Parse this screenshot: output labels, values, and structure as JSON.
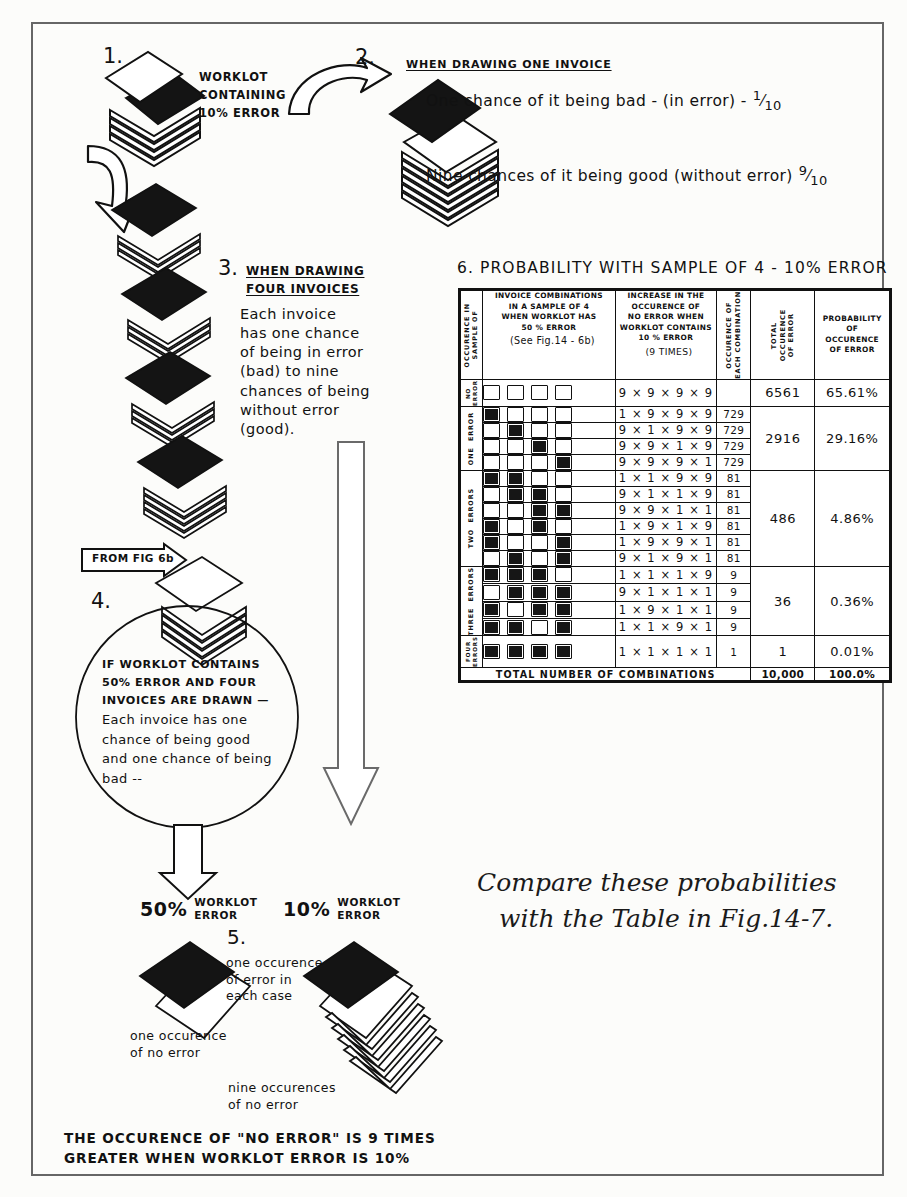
{
  "figure": {
    "title_top_right": "6.  PROBABILITY WITH SAMPLE OF 4 - 10% ERROR",
    "closing_note_line1": "Compare these probabilities",
    "closing_note_line2": "with the Table in Fig.14-7.",
    "bottom_conclusion_line1": "THE OCCURENCE OF \"NO ERROR\" IS 9 TIMES",
    "bottom_conclusion_line2": "GREATER WHEN WORKLOT ERROR IS 10%",
    "ink_color": "#111111",
    "paper_color": "#fcfcfa"
  },
  "step1": {
    "number": "1.",
    "label_line1": "WORKLOT",
    "label_line2": "CONTAINING",
    "label_line3": "10% ERROR"
  },
  "step2": {
    "number": "2.",
    "heading": "WHEN DRAWING ONE INVOICE",
    "line1": "One chance of it being bad - (in error) -",
    "line1_fraction_num": "1",
    "line1_fraction_den": "10",
    "line2": "Nine chances of it being good (without error)",
    "line2_fraction_num": "9",
    "line2_fraction_den": "10"
  },
  "step3": {
    "number": "3.",
    "heading_line1": "WHEN DRAWING",
    "heading_line2": "FOUR INVOICES",
    "body_lines": [
      "Each invoice",
      "has one chance",
      "of being in error",
      "(bad) to nine",
      "chances of being",
      "without error",
      "(good)."
    ]
  },
  "step4": {
    "number": "4.",
    "from_tag": "FROM FIG 6b",
    "bubble_lines": [
      "IF WORKLOT CONTAINS",
      "50% ERROR AND FOUR",
      "INVOICES ARE DRAWN —",
      "Each invoice has  one",
      "chance of being good",
      "and one chance of being",
      "bad --"
    ]
  },
  "branches": {
    "left_pct": "50%",
    "left_label_line1": "WORKLOT",
    "left_label_line2": "ERROR",
    "right_pct": "10%",
    "right_label_line1": "WORKLOT",
    "right_label_line2": "ERROR"
  },
  "step5": {
    "number": "5.",
    "note_lines": [
      "one occurence",
      "of error in",
      "each case"
    ],
    "left_caption_lines": [
      "one occurence",
      "of no error"
    ],
    "right_caption_lines": [
      "nine occurences",
      "of no error"
    ]
  },
  "chart_data": {
    "type": "table",
    "title": "6.  PROBABILITY WITH SAMPLE OF 4 - 10% ERROR",
    "columns": [
      "OCCURENCE IN SAMPLE OF",
      "INVOICE COMBINATIONS IN A SAMPLE OF 4 WHEN WORKLOT HAS 50 % ERROR (See Fig.14 - 6b)",
      "INCREASE IN THE OCCURENCE OF NO ERROR WHEN WORKLOT CONTAINS 10 % ERROR (9 TIMES)",
      "OCCURENCE OF EACH COMBINATION",
      "TOTAL OCCURENCE OF ERROR",
      "PROBABILITY OF OCCURENCE OF ERROR"
    ],
    "header_cells": {
      "c1": "OCCURENCE IN\nSAMPLE OF",
      "c2_lines": [
        "INVOICE COMBINATIONS",
        "IN A SAMPLE OF 4",
        "WHEN WORKLOT HAS",
        "50 % ERROR",
        "(See Fig.14 - 6b)"
      ],
      "c3_lines": [
        "INCREASE  IN THE",
        "OCCURENCE    OF",
        "NO ERROR WHEN",
        "WORKLOT CONTAINS",
        "10 % ERROR",
        "(9 TIMES)"
      ],
      "c4": "OCCURENCE OF\nEACH COMBINATION",
      "c5": "TOTAL\nOCCURENCE\nOF ERROR",
      "c6_lines": [
        "PROBABILITY",
        "OF",
        "OCCURENCE",
        "OF ERROR"
      ]
    },
    "groups": [
      {
        "label": "NO\nERROR",
        "total_occurence": "6561",
        "probability": "65.61%",
        "rows": [
          {
            "squares": [
              0,
              0,
              0,
              0
            ],
            "product": "9 × 9 × 9 × 9",
            "occurence": ""
          }
        ]
      },
      {
        "label": "ONE  ERROR",
        "total_occurence": "2916",
        "probability": "29.16%",
        "rows": [
          {
            "squares": [
              1,
              0,
              0,
              0
            ],
            "product": "1 × 9 × 9 × 9",
            "occurence": "729"
          },
          {
            "squares": [
              0,
              1,
              0,
              0
            ],
            "product": "9 × 1 × 9 × 9",
            "occurence": "729"
          },
          {
            "squares": [
              0,
              0,
              1,
              0
            ],
            "product": "9 × 9 × 1 × 9",
            "occurence": "729"
          },
          {
            "squares": [
              0,
              0,
              0,
              1
            ],
            "product": "9 × 9 × 9 × 1",
            "occurence": "729"
          }
        ]
      },
      {
        "label": "TWO  ERRORS",
        "total_occurence": "486",
        "probability": "4.86%",
        "rows": [
          {
            "squares": [
              1,
              1,
              0,
              0
            ],
            "product": "1 × 1 × 9 × 9",
            "occurence": "81"
          },
          {
            "squares": [
              0,
              1,
              1,
              0
            ],
            "product": "9 × 1 × 1 × 9",
            "occurence": "81"
          },
          {
            "squares": [
              0,
              0,
              1,
              1
            ],
            "product": "9 × 9 × 1 × 1",
            "occurence": "81"
          },
          {
            "squares": [
              1,
              0,
              1,
              0
            ],
            "product": "1 × 9 × 1 × 9",
            "occurence": "81"
          },
          {
            "squares": [
              1,
              0,
              0,
              1
            ],
            "product": "1 × 9 × 9 × 1",
            "occurence": "81"
          },
          {
            "squares": [
              0,
              1,
              0,
              1
            ],
            "product": "9 × 1 × 9 × 1",
            "occurence": "81"
          }
        ]
      },
      {
        "label": "THREE  ERRORS",
        "total_occurence": "36",
        "probability": "0.36%",
        "rows": [
          {
            "squares": [
              1,
              1,
              1,
              0
            ],
            "product": "1 × 1 × 1 × 9",
            "occurence": "9"
          },
          {
            "squares": [
              0,
              1,
              1,
              1
            ],
            "product": "9 × 1 × 1 × 1",
            "occurence": "9"
          },
          {
            "squares": [
              1,
              0,
              1,
              1
            ],
            "product": "1 × 9 × 1 × 1",
            "occurence": "9"
          },
          {
            "squares": [
              1,
              1,
              0,
              1
            ],
            "product": "1 × 1 × 9 × 1",
            "occurence": "9"
          }
        ]
      },
      {
        "label": "FOUR\nERRORS",
        "total_occurence": "1",
        "probability": "0.01%",
        "rows": [
          {
            "squares": [
              1,
              1,
              1,
              1
            ],
            "product": "1 × 1 × 1 × 1",
            "occurence": "1"
          }
        ]
      }
    ],
    "footer": {
      "label": "TOTAL   NUMBER OF COMBINATIONS",
      "total": "10,000",
      "probability": "100.0%"
    }
  }
}
